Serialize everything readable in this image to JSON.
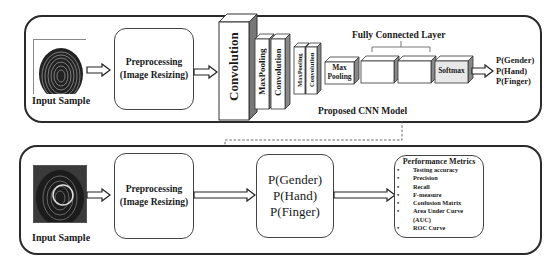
{
  "top_panel": {
    "input_label": "Input Sample",
    "preprocessing": {
      "line1": "Preprocessing",
      "line2": "(Image Resizing)"
    },
    "cnn_layers": {
      "conv1": "Convolution",
      "maxpool1": "MaxPooling",
      "conv2": "Convolution",
      "maxpool2": "MaxPooling",
      "conv3": "Convolution",
      "maxpool3": {
        "line1": "Max",
        "line2": "Pooling"
      },
      "fully_connected_label": "Fully Connected Layer",
      "softmax": "Softmax"
    },
    "outputs": [
      "P(Gender)",
      "P(Hand)",
      "P(Finger)"
    ],
    "model_caption": "Proposed CNN Model"
  },
  "bottom_panel": {
    "input_label": "Input Sample",
    "preprocessing": {
      "line1": "Preprocessing",
      "line2": "(Image Resizing)"
    },
    "predictions": [
      "P(Gender)",
      "P(Hand)",
      "P(Finger)"
    ],
    "metrics": {
      "title": "Performance Metrics",
      "items": [
        "Testing accuracy",
        "Precision",
        "Recall",
        "F-measure",
        "Confusion Matrix",
        "Area Under Curve",
        "(AUC)",
        "ROC Curve"
      ]
    }
  }
}
